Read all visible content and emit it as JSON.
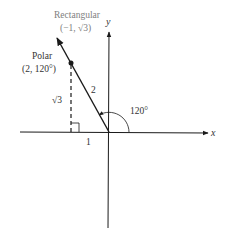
{
  "diagram": {
    "axes": {
      "x_label": "x",
      "y_label": "y"
    },
    "rectangular": {
      "title": "Rectangular",
      "coords": "(−1, √3)"
    },
    "polar": {
      "title": "Polar",
      "coords": "(2, 120°)"
    },
    "radius_label": "2",
    "vertical_leg_label": "√3",
    "horizontal_leg_label": "1",
    "angle_label": "120°",
    "colors": {
      "stroke": "#1a1a1a",
      "label_gray": "#808080",
      "text": "#333333"
    }
  }
}
